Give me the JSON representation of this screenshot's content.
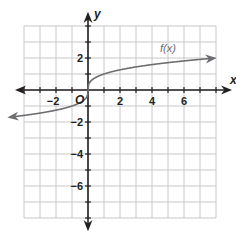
{
  "chart_data": {
    "type": "line",
    "title": "",
    "xlabel": "x",
    "ylabel": "y",
    "origin_label": "O",
    "xlim": [
      -4,
      8
    ],
    "ylim": [
      -8,
      4
    ],
    "grid": true,
    "grid_step": 1,
    "x_ticks": [
      -2,
      2,
      4,
      6
    ],
    "x_tick_labels": [
      "−2",
      "2",
      "4",
      "6"
    ],
    "y_ticks": [
      2,
      -2,
      -4,
      -6
    ],
    "y_tick_labels": [
      "2",
      "−2",
      "−4",
      "−6"
    ],
    "series": [
      {
        "name": "f(x)",
        "label": "f(x)",
        "function": "cube root",
        "x": [
          -4,
          -3,
          -2,
          -1,
          -0.5,
          -0.1,
          0,
          0.1,
          0.5,
          1,
          2,
          3,
          4,
          5,
          6,
          7,
          8
        ],
        "y": [
          -1.59,
          -1.44,
          -1.26,
          -1.0,
          -0.79,
          -0.46,
          0,
          0.46,
          0.79,
          1.0,
          1.26,
          1.44,
          1.59,
          1.71,
          1.82,
          1.91,
          2.0
        ],
        "arrows_both_ends": true
      }
    ],
    "legend": "inline label near curve at x≈4.5",
    "colors": {
      "grid": "#c8c8c8",
      "axes": "#231f20",
      "curve": "#6d6e71"
    }
  }
}
